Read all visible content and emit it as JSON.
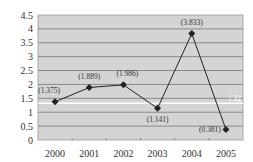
{
  "chart_data": {
    "type": "line",
    "title": "",
    "xlabel": "",
    "ylabel": "",
    "categories": [
      "2000",
      "2001",
      "2002",
      "2003",
      "2004",
      "2005"
    ],
    "series": [
      {
        "name": "",
        "values": [
          1.375,
          1.889,
          1.986,
          1.141,
          3.833,
          0.381
        ],
        "labels": [
          "(1.375)",
          "(1.889)",
          "(1.986)",
          "(1.141)",
          "(3.833)",
          "(0.381)"
        ],
        "marker": "diamond",
        "color": "#222222"
      }
    ],
    "reference_line": {
      "value": 1.32,
      "label": "1.32",
      "color": "#ffffff"
    },
    "ylim": [
      0,
      4.5
    ],
    "yticks": [
      "0",
      "0.5",
      "1",
      "1.5",
      "2",
      "2.5",
      "3",
      "3.5",
      "4",
      "4.5"
    ],
    "grid": true,
    "legend": "none",
    "plot_background": "#d4d4d4",
    "gridline_color": "#8a8a8a"
  }
}
